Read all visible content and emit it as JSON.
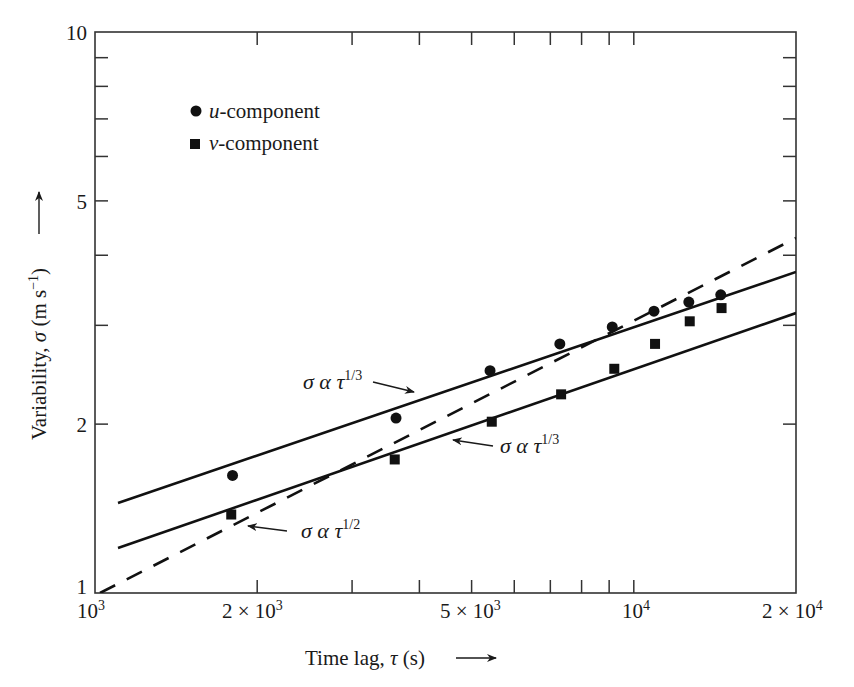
{
  "chart_data": {
    "type": "scatter",
    "title": "",
    "xlabel": "Time lag, τ (s)",
    "ylabel": "Variability, σ (m s⁻¹)",
    "xscale": "log",
    "yscale": "log",
    "xlim": [
      1000,
      20000
    ],
    "ylim": [
      1,
      10
    ],
    "grid": false,
    "legend_position": "upper-left",
    "x_ticks": [
      {
        "value": 1000,
        "label": "10",
        "sup": "3"
      },
      {
        "value": 2000,
        "label": "2 × 10",
        "sup": "3"
      },
      {
        "value": 5000,
        "label": "5 × 10",
        "sup": "3"
      },
      {
        "value": 10000,
        "label": "10",
        "sup": "4"
      },
      {
        "value": 20000,
        "label": "2 × 10",
        "sup": "4"
      }
    ],
    "y_ticks": [
      {
        "value": 1,
        "label": "1"
      },
      {
        "value": 2,
        "label": "2"
      },
      {
        "value": 5,
        "label": "5"
      },
      {
        "value": 10,
        "label": "10"
      }
    ],
    "series": [
      {
        "name": "u-component",
        "marker": "circle",
        "x": [
          1800,
          3620,
          5410,
          7290,
          9120,
          10900,
          12650,
          14500
        ],
        "y": [
          1.62,
          2.05,
          2.49,
          2.78,
          2.98,
          3.18,
          3.3,
          3.4
        ]
      },
      {
        "name": "v-component",
        "marker": "square",
        "x": [
          1790,
          3600,
          5450,
          7330,
          9200,
          10950,
          12700,
          14550
        ],
        "y": [
          1.38,
          1.73,
          2.02,
          2.26,
          2.51,
          2.78,
          3.05,
          3.22
        ]
      }
    ],
    "fit_lines": [
      {
        "name": "σ α τ^1/3 (u)",
        "style": "solid",
        "x": [
          1100,
          20000
        ],
        "y": [
          1.47,
          3.8
        ]
      },
      {
        "name": "σ α τ^1/3 (v)",
        "style": "solid",
        "x": [
          1100,
          20000
        ],
        "y": [
          1.22,
          3.21
        ]
      },
      {
        "name": "σ α τ^1/2",
        "style": "dashed",
        "x": [
          1020,
          20000
        ],
        "y": [
          1.0,
          4.29
        ]
      }
    ],
    "annotations": [
      {
        "text": "σ α τ",
        "sup": "1/3",
        "target": "upper solid line"
      },
      {
        "text": "σ α τ",
        "sup": "1/3",
        "target": "lower solid line"
      },
      {
        "text": "σ α τ",
        "sup": "1/2",
        "target": "dashed line"
      }
    ]
  },
  "legend": {
    "items": [
      {
        "italic": "u",
        "rest": "-component"
      },
      {
        "italic": "v",
        "rest": "-component"
      }
    ]
  },
  "axes": {
    "x_title": "Time lag, ",
    "x_symbol": "τ",
    "x_unit": " (s)",
    "y_title": "Variability, ",
    "y_symbol": "σ",
    "y_unit": " (m s",
    "y_unit_sup": "−1",
    "y_unit_close": ")"
  },
  "labels": {
    "anno_upper": {
      "base": "σ α τ",
      "sup": "1/3"
    },
    "anno_lower": {
      "base": "σ α τ",
      "sup": "1/3"
    },
    "anno_dashed": {
      "base": "σ α τ",
      "sup": "1/2"
    }
  }
}
